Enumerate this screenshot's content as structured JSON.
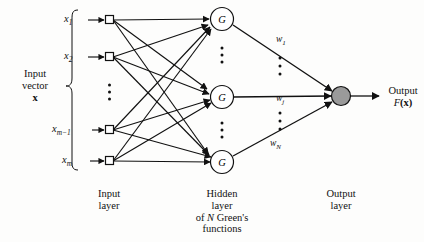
{
  "figure": {
    "type": "neural-network-diagram"
  },
  "colors": {
    "stroke": "#111111",
    "background": "#fdfdfc",
    "output_node_fill": "#9a9a9a",
    "input_node_fill": "#ffffff",
    "hidden_node_fill": "#ffffff"
  },
  "input_vector": {
    "caption_line1": "Input",
    "caption_line2": "vector",
    "caption_line3": "x",
    "brace": "left-curly-brace"
  },
  "inputs": [
    {
      "id": "x1",
      "base": "x",
      "sub": "1",
      "cy": 20
    },
    {
      "id": "x2",
      "base": "x",
      "sub": "2",
      "cy": 57
    },
    {
      "id": "xm-1",
      "base": "x",
      "sub": "m−1",
      "cy": 130
    },
    {
      "id": "xm",
      "base": "x",
      "sub": "m",
      "cy": 161
    }
  ],
  "input_ellipsis": {
    "label": "vertical-ellipsis",
    "dots": 3
  },
  "hidden": [
    {
      "id": "G1",
      "glyph": "G",
      "cy": 19
    },
    {
      "id": "Gj",
      "glyph": "G",
      "cy": 97
    },
    {
      "id": "GN",
      "glyph": "G",
      "cy": 162
    }
  ],
  "hidden_ellipses": [
    {
      "label": "vertical-ellipsis-upper",
      "dots": 3
    },
    {
      "label": "vertical-ellipsis-lower",
      "dots": 3
    }
  ],
  "weights": [
    {
      "id": "w1",
      "base": "w",
      "sub": "1",
      "x": 276,
      "y": 41
    },
    {
      "id": "wj",
      "base": "w",
      "sub": "j",
      "x": 276,
      "y": 100
    },
    {
      "id": "wN",
      "base": "w",
      "sub": "N",
      "x": 270,
      "y": 145
    }
  ],
  "weight_ellipses": [
    {
      "label": "weight-ellipsis-upper",
      "dots": 3
    },
    {
      "label": "weight-ellipsis-lower",
      "dots": 3
    }
  ],
  "output": {
    "node_label": "output-summing-node",
    "caption_line1": "Output",
    "caption_line2_base": "F",
    "caption_line2_arg": "(x)"
  },
  "layer_captions": {
    "input": {
      "line1": "Input",
      "line2": "layer"
    },
    "hidden": {
      "line1": "Hidden",
      "line2": "layer",
      "line3_pre": "of ",
      "line3_ital": "N",
      "line3_post": " Green's",
      "line4": "functions"
    },
    "output": {
      "line1": "Output",
      "line2": "layer"
    }
  }
}
